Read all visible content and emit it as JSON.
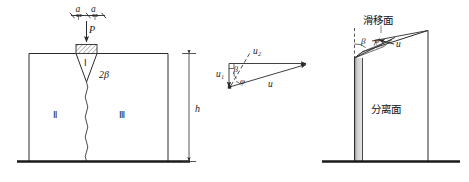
{
  "figure": {
    "title": "",
    "panels": [
      {
        "id": "left",
        "name": "punch-indentation-panel",
        "labels": {
          "width_a_left": "a",
          "width_a_right": "a",
          "load": "P",
          "wedge_region": "Ⅰ",
          "angle_2beta": "2β",
          "region_two": "Ⅱ",
          "region_three": "Ⅲ",
          "height": "h"
        }
      },
      {
        "id": "middle",
        "name": "velocity-hodograph-panel",
        "labels": {
          "u1": "u₁",
          "u2": "u₂",
          "u": "u",
          "beta": "β",
          "phi": "φ"
        }
      },
      {
        "id": "right",
        "name": "slip-separation-panel",
        "labels": {
          "slip_surface": "滑移面",
          "separation_surface": "分离面",
          "beta": "β",
          "phi": "φ",
          "velocity_u": "u"
        }
      }
    ]
  },
  "colors": {
    "line": "#2b2b2b",
    "ground": "#1a1a1a",
    "hatch": "#555555",
    "band_light": "#d9d9d9",
    "band_dark": "#9a9a9a",
    "background": "#ffffff"
  }
}
